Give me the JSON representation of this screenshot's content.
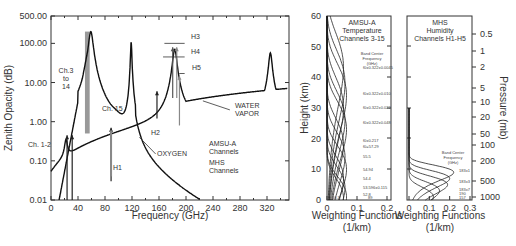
{
  "chart_data": [
    {
      "type": "line",
      "title": "",
      "xlabel": "Frequency (GHz)",
      "ylabel": "Zenith Opacity (dB)",
      "yscale": "log",
      "xlim": [
        0,
        350
      ],
      "ylim": [
        0.01,
        500
      ],
      "xticks": [
        "0",
        "40",
        "80",
        "120",
        "160",
        "200",
        "240",
        "280",
        "320"
      ],
      "yticks": [
        "0.01",
        "0.10",
        "1.00",
        "10.00",
        "100.00",
        "500.00"
      ],
      "series": [
        {
          "name": "OXYGEN",
          "x": [
            10,
            20,
            30,
            40,
            50,
            55,
            60,
            65,
            70,
            80,
            90,
            100,
            110,
            115,
            118.75,
            122,
            130,
            140,
            160,
            180,
            200,
            220
          ],
          "values": [
            0.01,
            0.05,
            0.2,
            1.5,
            30,
            150,
            200,
            60,
            8,
            0.8,
            0.15,
            0.2,
            1.5,
            20,
            120,
            15,
            0.8,
            0.3,
            0.08,
            0.03,
            0.015,
            0.01
          ]
        },
        {
          "name": "WATER VAPOR",
          "x": [
            0,
            10,
            20,
            22.2,
            25,
            30,
            40,
            60,
            80,
            100,
            120,
            150,
            170,
            180,
            183.3,
            186,
            190,
            200,
            220,
            250,
            280,
            310,
            325,
            330,
            340,
            350
          ],
          "values": [
            0.03,
            0.035,
            0.08,
            0.3,
            0.12,
            0.1,
            0.12,
            0.2,
            0.35,
            0.55,
            0.9,
            1.8,
            6,
            30,
            60,
            30,
            6,
            3.5,
            3.2,
            3.8,
            5,
            7.5,
            60,
            12,
            8,
            9
          ]
        }
      ],
      "annotations": [
        {
          "text": "Ch. 1-2",
          "x": 23.8,
          "note": "arrows at 23.8 and 31.4 GHz"
        },
        {
          "text": "Ch.3 to 14",
          "x": 50.3,
          "note": "shaded band ~50-58 GHz"
        },
        {
          "text": "Ch. 15",
          "x": 89
        },
        {
          "text": "H1",
          "x": 89
        },
        {
          "text": "H2",
          "x": 157
        },
        {
          "text": "H3",
          "x": 183.3
        },
        {
          "text": "H4",
          "x": 183.3
        },
        {
          "text": "H5",
          "x": 190.3
        },
        {
          "text": "OXYGEN"
        },
        {
          "text": "WATER VAPOR"
        }
      ],
      "legend": [
        "AMSU-A Channels",
        "MHS Channels"
      ],
      "grid": false
    },
    {
      "type": "line",
      "title": "AMSU-A Temperature Channels 3-15",
      "xlabel": "Weighting Functions (1/km)",
      "ylabel": "Height (km)",
      "xlim": [
        0,
        0.2
      ],
      "ylim": [
        0,
        60
      ],
      "xticks": [
        "0",
        "0.1",
        "0.2"
      ],
      "yticks": [
        "0",
        "10",
        "20",
        "30",
        "40",
        "50",
        "60"
      ],
      "legend_title": "Band Center Frequency (GHz)",
      "channels": [
        "f0±0.322±0.0045",
        "f0±0.322±0.010",
        "f0±0.322±0.022",
        "f0±0.322±0.048",
        "f0±0.217",
        "f0=57.29",
        "55.5",
        "54.94",
        "54.4",
        "53.596±0.115",
        "52.8",
        "50.3",
        "89"
      ],
      "series_peaks_km": [
        43,
        38,
        34,
        30,
        26,
        23,
        18,
        14,
        10,
        7,
        4,
        1,
        0.5
      ]
    },
    {
      "type": "line",
      "title": "MHS Humidity Channels H1-H5",
      "xlabel": "Weighting Functions (1/km)",
      "ylabel": "Pressure (mb)",
      "xlim": [
        0,
        0.3
      ],
      "xticks": [
        "0",
        "0.1",
        "0.2",
        "0.3"
      ],
      "yticks": [
        "0.5",
        "1",
        "2",
        "5",
        "10",
        "20",
        "50",
        "100",
        "200",
        "500",
        "1000"
      ],
      "legend_title": "Band Center Frequency (GHz)",
      "channels": [
        "183±1",
        "183±3",
        "183±7",
        "190",
        "157"
      ],
      "series_peaks_km": [
        9,
        7,
        5,
        3,
        1
      ]
    }
  ],
  "labels": {
    "main_xlabel": "Frequency (GHz)",
    "main_ylabel": "Zenith Opacity (dB)",
    "oxygen": "OXYGEN",
    "water1": "WATER",
    "water2": "VAPOR",
    "ch12": "Ch. 1-2",
    "ch3a": "Ch.3",
    "ch3b": "to",
    "ch3c": "14",
    "ch15": "Ch. 15",
    "h1": "H1",
    "h2": "H2",
    "h3": "H3",
    "h4": "H4",
    "h5": "H5",
    "legend_amsu1": "AMSU-A",
    "legend_amsu2": "Channels",
    "legend_mhs1": "MHS",
    "legend_mhs2": "Channels",
    "amsu_t1": "AMSU-A",
    "amsu_t2": "Temperature",
    "amsu_t3": "Channels 3-15",
    "mhs_t1": "MHS",
    "mhs_t2": "Humidity",
    "mhs_t3": "Channels H1-H5",
    "bcf1": "Band Center",
    "bcf2": "Frequency",
    "bcf3": "(GHz)",
    "wf": "Weighting Functions",
    "wfu": "(1/km)",
    "height": "Height (km)",
    "pressure": "Pressure (mb)"
  },
  "colors": {
    "line": "#111111",
    "shade": "#999999",
    "frame": "#333333",
    "text": "#333333"
  }
}
